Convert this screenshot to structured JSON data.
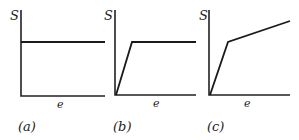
{
  "figure": {
    "panels": [
      {
        "id": "a",
        "caption": "(a)",
        "y_axis_label": "S",
        "x_axis_label": "e",
        "curve_description": "constant horizontal line",
        "curve_points": [
          [
            0,
            0.62
          ],
          [
            1,
            0.62
          ]
        ]
      },
      {
        "id": "b",
        "caption": "(b)",
        "y_axis_label": "S",
        "x_axis_label": "e",
        "curve_description": "steep linear rise from origin then horizontal plateau",
        "curve_points": [
          [
            0,
            0
          ],
          [
            0.2,
            0.62
          ],
          [
            1,
            0.62
          ]
        ]
      },
      {
        "id": "c",
        "caption": "(c)",
        "y_axis_label": "S",
        "x_axis_label": "e",
        "curve_description": "steep linear rise from origin then shallower linear rise",
        "curve_points": [
          [
            0,
            0
          ],
          [
            0.23,
            0.62
          ],
          [
            1,
            0.87
          ]
        ]
      }
    ],
    "colors": {
      "line": "#1a1a1a",
      "text": "#222222",
      "background": "#ffffff"
    }
  }
}
